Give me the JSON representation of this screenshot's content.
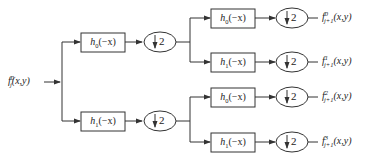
{
  "diagram": {
    "type": "two-level filter bank decomposition",
    "input": {
      "base": "f",
      "sub": "j",
      "sup": "0",
      "args": "(x,y)"
    },
    "level1": [
      {
        "filter": {
          "base": "h",
          "sub": "0",
          "args": "(−x)"
        },
        "downsample": "2"
      },
      {
        "filter": {
          "base": "h",
          "sub": "1",
          "args": "(−x)"
        },
        "downsample": "2"
      }
    ],
    "level2": [
      {
        "filter": {
          "base": "h",
          "sub": "0",
          "args": "(−x)"
        },
        "downsample": "2",
        "output": {
          "base": "f",
          "sub": "j+1",
          "sup": "0",
          "args": "(x,y)"
        }
      },
      {
        "filter": {
          "base": "h",
          "sub": "1",
          "args": "(−x)"
        },
        "downsample": "2",
        "output": {
          "base": "f",
          "sub": "j+1",
          "sup": "1",
          "args": "(x,y)"
        }
      },
      {
        "filter": {
          "base": "h",
          "sub": "0",
          "args": "(−x)"
        },
        "downsample": "2",
        "output": {
          "base": "f",
          "sub": "j+1",
          "sup": "2",
          "args": "(x,y)"
        }
      },
      {
        "filter": {
          "base": "h",
          "sub": "1",
          "args": "(−x)"
        },
        "downsample": "2",
        "output": {
          "base": "f",
          "sub": "j+1",
          "sup": "3",
          "args": "(x,y)"
        }
      }
    ],
    "colors": {
      "stroke": "#333333",
      "box_fill": "#ffffff",
      "text": "#222222"
    }
  }
}
